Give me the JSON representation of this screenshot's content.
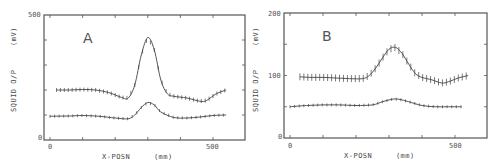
{
  "chart_data": [
    {
      "type": "line",
      "panel_label": "A",
      "title": "",
      "xlabel": "X-POSN",
      "xunit": "(mm)",
      "ylabel": "SQUID O/P",
      "yunit": "(mV)",
      "xlim": [
        -20,
        600
      ],
      "ylim": [
        0,
        500
      ],
      "xticks": [
        "0",
        "500"
      ],
      "yticks": [
        "0",
        "500"
      ],
      "grid": false,
      "series": [
        {
          "name": "upper (with error bars)",
          "x": [
            20,
            60,
            100,
            140,
            180,
            220,
            240,
            260,
            280,
            300,
            320,
            340,
            360,
            380,
            420,
            460,
            480,
            510,
            540
          ],
          "values": [
            200,
            200,
            202,
            200,
            190,
            170,
            168,
            220,
            340,
            410,
            360,
            240,
            185,
            175,
            168,
            155,
            158,
            185,
            200
          ]
        },
        {
          "name": "lower",
          "x": [
            0,
            60,
            100,
            150,
            200,
            240,
            260,
            280,
            300,
            320,
            340,
            380,
            420,
            460,
            500,
            540
          ],
          "values": [
            95,
            96,
            98,
            95,
            88,
            85,
            100,
            130,
            150,
            140,
            112,
            90,
            88,
            92,
            98,
            100
          ]
        }
      ]
    },
    {
      "type": "line",
      "panel_label": "B",
      "title": "",
      "xlabel": "X-POSN",
      "xunit": "(mm)",
      "ylabel": "SQUID O/P",
      "yunit": "(mV)",
      "xlim": [
        -20,
        600
      ],
      "ylim": [
        0,
        200
      ],
      "xticks": [
        "0",
        "500"
      ],
      "yticks": [
        "0",
        "100",
        "200"
      ],
      "grid": false,
      "series": [
        {
          "name": "upper (with error bars)",
          "x": [
            30,
            60,
            100,
            140,
            180,
            220,
            240,
            260,
            280,
            300,
            320,
            340,
            360,
            380,
            400,
            430,
            460,
            480,
            510,
            540
          ],
          "values": [
            98,
            97,
            97,
            96,
            95,
            95,
            100,
            112,
            128,
            142,
            145,
            135,
            118,
            103,
            97,
            93,
            88,
            90,
            96,
            100
          ]
        },
        {
          "name": "lower",
          "x": [
            0,
            50,
            100,
            150,
            200,
            250,
            280,
            310,
            330,
            360,
            400,
            440,
            480,
            520
          ],
          "values": [
            50,
            52,
            53,
            53,
            52,
            53,
            58,
            62,
            62,
            58,
            52,
            50,
            50,
            50
          ]
        }
      ]
    }
  ]
}
